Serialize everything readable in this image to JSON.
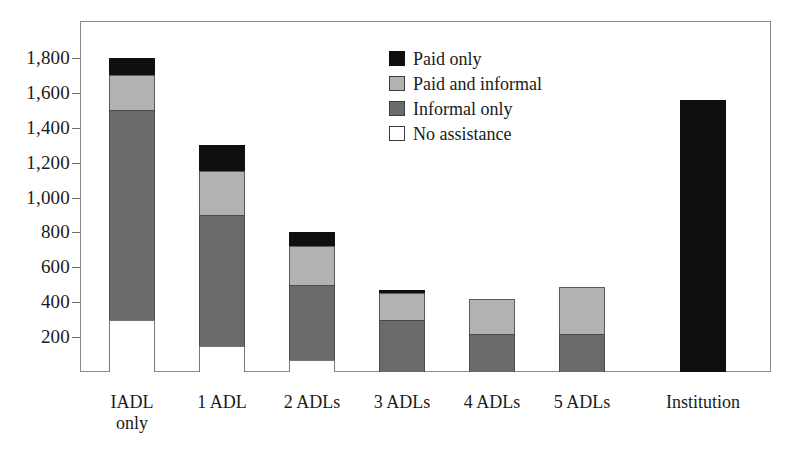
{
  "chart_data": {
    "type": "bar",
    "subtype": "stacked-bar",
    "title": "",
    "xlabel": "",
    "ylabel": "",
    "ylim": [
      0,
      1900
    ],
    "grid": false,
    "legend_position": "inside-top-center",
    "y_ticks": [
      "200",
      "400",
      "600",
      "800",
      "1,000",
      "1,200",
      "1,400",
      "1,600",
      "1,800"
    ],
    "y_tick_values": [
      200,
      400,
      600,
      800,
      1000,
      1200,
      1400,
      1600,
      1800
    ],
    "categories": [
      "IADL\nonly",
      "1 ADL",
      "2 ADLs",
      "3 ADLs",
      "4 ADLs",
      "5 ADLs",
      "Institution"
    ],
    "series": [
      {
        "name": "No assistance",
        "color": "#ffffff",
        "values": [
          300,
          150,
          70,
          0,
          0,
          0,
          0
        ]
      },
      {
        "name": "Informal only",
        "color": "#6b6b6b",
        "values": [
          1200,
          750,
          430,
          300,
          220,
          220,
          0
        ]
      },
      {
        "name": "Paid and informal",
        "color": "#b2b2b2",
        "values": [
          200,
          250,
          220,
          150,
          200,
          270,
          0
        ]
      },
      {
        "name": "Paid only",
        "color": "#0f0f0f",
        "values": [
          100,
          150,
          80,
          20,
          0,
          0,
          1560
        ]
      }
    ],
    "totals": [
      1800,
      1300,
      800,
      470,
      420,
      490,
      1560
    ]
  },
  "legend": {
    "items": [
      {
        "label": "Paid only",
        "swatch": "swatch-paid-only"
      },
      {
        "label": "Paid and informal",
        "swatch": "swatch-paid-and-informal"
      },
      {
        "label": "Informal only",
        "swatch": "swatch-informal-only"
      },
      {
        "label": "No assistance",
        "swatch": "swatch-no-assistance"
      }
    ]
  },
  "colors": {
    "paid_only": "#0f0f0f",
    "paid_and_informal": "#b2b2b2",
    "informal_only": "#6b6b6b",
    "no_assistance": "#ffffff",
    "frame": "#8a8a8a",
    "text": "#1a1a1a"
  }
}
